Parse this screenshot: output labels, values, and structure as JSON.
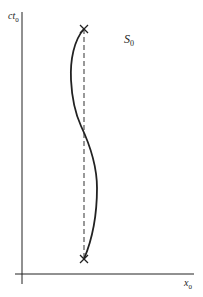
{
  "diagram": {
    "type": "spacetime-diagram",
    "frame_label": {
      "main": "S",
      "sub": "0"
    },
    "y_axis_label": {
      "main": "ct",
      "sub": "0"
    },
    "x_axis_label": {
      "main": "x",
      "sub": "0"
    },
    "events": [
      {
        "name": "top-event",
        "marker": "×"
      },
      {
        "name": "bottom-event",
        "marker": "×"
      }
    ],
    "paths": [
      {
        "name": "worldline-curve",
        "style": "solid"
      },
      {
        "name": "straight-worldline",
        "style": "dashed"
      }
    ],
    "colors": {
      "ink": "#222222",
      "dashed": "#555555",
      "background": "#ffffff"
    }
  }
}
